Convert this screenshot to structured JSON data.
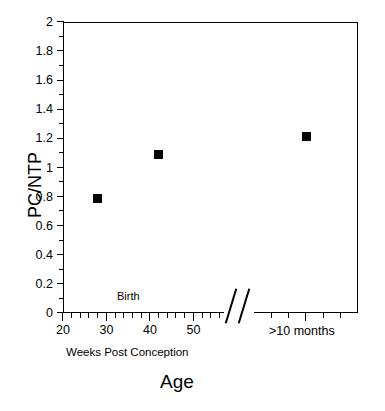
{
  "chart_data": {
    "type": "scatter",
    "title": "Age",
    "xlabel": "Weeks Post Conception",
    "ylabel": "PC/NTP",
    "ylim": [
      0,
      2
    ],
    "y_major_step": 0.2,
    "y_minor_step": 0.1,
    "grid": false,
    "legend": null,
    "axis_break": true,
    "axis_break_symbol": "//",
    "x_segments": [
      {
        "name": "weeks-post-conception",
        "type": "numeric",
        "xlim": [
          20,
          57
        ],
        "tick_major_step": 10,
        "tick_minor_step": 2,
        "tick_labels": [
          "20",
          "30",
          "40",
          "50"
        ],
        "tick_values": [
          20,
          30,
          40,
          50
        ],
        "label": "Weeks Post Conception"
      },
      {
        "name": "older-infants",
        "type": "categorical",
        "tick_labels": [
          ">10 months"
        ],
        "label": ">10 months"
      }
    ],
    "y_tick_labels": [
      "0",
      "0.2",
      "0.4",
      "0.6",
      "0.8",
      "1",
      "1.2",
      "1.4",
      "1.6",
      "1.8",
      "2"
    ],
    "y_tick_values": [
      0,
      0.2,
      0.4,
      0.6,
      0.8,
      1.0,
      1.2,
      1.4,
      1.6,
      1.8,
      2.0
    ],
    "series": [
      {
        "name": "PC/NTP",
        "marker": "filled-square",
        "color": "#000000",
        "points": [
          {
            "x": 28,
            "x_label": "28 weeks",
            "y": 0.79,
            "segment": "weeks-post-conception"
          },
          {
            "x": 42,
            "x_label": "42 weeks",
            "y": 1.09,
            "segment": "weeks-post-conception"
          },
          {
            "x": null,
            "x_label": ">10 months",
            "y": 1.21,
            "segment": "older-infants"
          }
        ]
      }
    ],
    "annotations": [
      {
        "text": "Birth",
        "x": 42,
        "y": 0.1,
        "segment": "weeks-post-conception"
      }
    ]
  },
  "colors": {
    "axis": "#000000",
    "marker": "#000000",
    "background": "#ffffff"
  }
}
